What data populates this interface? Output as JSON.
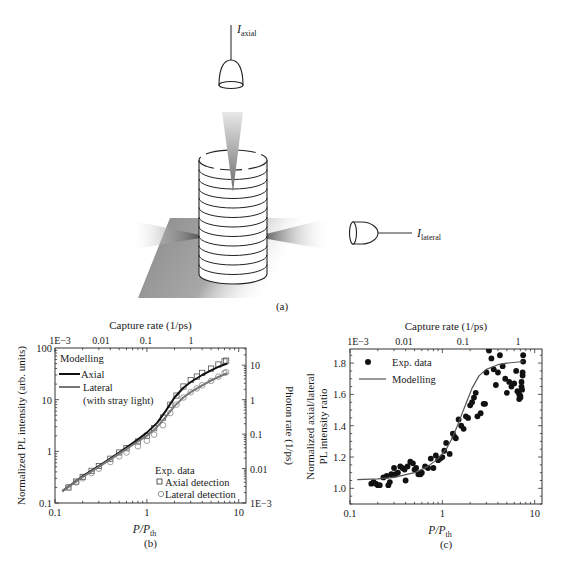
{
  "panel_a": {
    "label": "(a)",
    "axial_detector_label": "I",
    "axial_detector_sub": "axial",
    "lateral_detector_label": "I",
    "lateral_detector_sub": "lateral",
    "num_layers": 12
  },
  "chart_data": [
    {
      "id": "b",
      "type": "line",
      "panel_label": "(b)",
      "title": "",
      "top_axis_title": "Capture rate (1/ps)",
      "top_ticks": [
        "1E−3",
        "0.01",
        "0.1",
        "1"
      ],
      "xlabel": "P/P",
      "xlabel_sub": "th",
      "ylabel": "Normalized PL intensity (arb. units)",
      "y2label": "Photon rate (1/ps)",
      "xscale": "log",
      "yscale": "log",
      "xlim": [
        0.1,
        12
      ],
      "ylim": [
        0.1,
        100
      ],
      "x_ticks": [
        "0.1",
        "1",
        "10"
      ],
      "y_ticks": [
        "0.1",
        "1",
        "10",
        "100"
      ],
      "y2_ticks": [
        "1E−3",
        "0.01",
        "0.1",
        "1",
        "10"
      ],
      "legend_modelling_title": "Modelling",
      "legend_exp_title": "Exp. data",
      "series": [
        {
          "name": "Axial",
          "kind": "model",
          "color": "#111111",
          "x": [
            0.12,
            0.2,
            0.3,
            0.5,
            0.8,
            1.0,
            1.3,
            1.6,
            2.0,
            2.5,
            3.0,
            4.0,
            5.0,
            6.0,
            7.0,
            7.5
          ],
          "y": [
            0.17,
            0.33,
            0.52,
            0.95,
            1.7,
            2.3,
            3.6,
            6.0,
            11.0,
            17.0,
            22.0,
            30.0,
            37.0,
            43.0,
            48.0,
            50.0
          ]
        },
        {
          "name": "Lateral (with stray light)",
          "kind": "model",
          "color": "#777777",
          "x": [
            0.12,
            0.2,
            0.3,
            0.5,
            0.8,
            1.0,
            1.3,
            1.6,
            2.0,
            2.5,
            3.0,
            4.0,
            5.0,
            6.0,
            7.0,
            7.5
          ],
          "y": [
            0.17,
            0.32,
            0.5,
            0.9,
            1.55,
            2.0,
            3.0,
            4.6,
            7.5,
            11.0,
            14.0,
            19.0,
            23.5,
            27.5,
            31.0,
            32.5
          ]
        },
        {
          "name": "Axial detection",
          "kind": "exp",
          "marker": "square",
          "x": [
            0.14,
            0.17,
            0.2,
            0.25,
            0.3,
            0.4,
            0.5,
            0.6,
            0.8,
            1.0,
            1.2,
            1.5,
            1.8,
            2.1,
            2.5,
            3.0,
            3.5,
            4.0,
            5.0,
            6.0,
            7.0,
            7.3
          ],
          "y": [
            0.2,
            0.26,
            0.32,
            0.42,
            0.52,
            0.72,
            0.95,
            1.15,
            1.55,
            2.0,
            2.8,
            4.5,
            8.0,
            12.0,
            18.0,
            24.0,
            28.0,
            33.0,
            40.0,
            48.0,
            55.0,
            57.0
          ]
        },
        {
          "name": "Lateral detection",
          "kind": "exp",
          "marker": "circle",
          "x": [
            0.14,
            0.17,
            0.2,
            0.25,
            0.3,
            0.4,
            0.5,
            0.6,
            0.8,
            1.0,
            1.2,
            1.5,
            1.8,
            2.1,
            2.5,
            3.0,
            3.5,
            4.0,
            5.0,
            6.0,
            7.0,
            7.3
          ],
          "y": [
            0.2,
            0.25,
            0.3,
            0.38,
            0.46,
            0.62,
            0.8,
            0.95,
            1.25,
            1.6,
            2.1,
            3.2,
            5.5,
            8.0,
            11.0,
            14.0,
            16.5,
            19.0,
            23.0,
            28.0,
            33.0,
            34.0
          ]
        }
      ]
    },
    {
      "id": "c",
      "type": "scatter",
      "panel_label": "(c)",
      "title": "",
      "top_axis_title": "Capture rate (1/ps)",
      "top_ticks": [
        "1E−3",
        "0.01",
        "0.1",
        "1"
      ],
      "xlabel": "P/P",
      "xlabel_sub": "th",
      "ylabel": "Normalized axial/lateral",
      "ylabel2": "PL intensity ratio",
      "xscale": "log",
      "yscale": "linear",
      "xlim": [
        0.1,
        12
      ],
      "ylim": [
        0.9,
        1.89
      ],
      "x_ticks": [
        "0.1",
        "1",
        "10"
      ],
      "y_ticks": [
        "1.0",
        "1.2",
        "1.4",
        "1.6",
        "1.8"
      ],
      "legend": [
        "Exp. data",
        "Modelling"
      ],
      "series": [
        {
          "name": "Modelling",
          "kind": "model",
          "color": "#555555",
          "x": [
            0.12,
            0.2,
            0.3,
            0.5,
            0.7,
            0.9,
            1.1,
            1.3,
            1.5,
            1.8,
            2.1,
            2.5,
            3.0,
            4.0,
            5.0,
            7.5
          ],
          "y": [
            1.055,
            1.06,
            1.07,
            1.1,
            1.14,
            1.19,
            1.25,
            1.33,
            1.42,
            1.54,
            1.64,
            1.72,
            1.76,
            1.79,
            1.8,
            1.81
          ]
        },
        {
          "name": "Exp. data",
          "kind": "exp",
          "marker": "dot",
          "x": [
            0.17,
            0.18,
            0.19,
            0.2,
            0.21,
            0.23,
            0.25,
            0.26,
            0.27,
            0.28,
            0.3,
            0.31,
            0.33,
            0.35,
            0.37,
            0.39,
            0.4,
            0.42,
            0.45,
            0.48,
            0.5,
            0.52,
            0.55,
            0.58,
            0.6,
            0.65,
            0.7,
            0.75,
            0.8,
            0.85,
            0.9,
            0.95,
            1.0,
            1.05,
            1.1,
            1.2,
            1.3,
            1.35,
            1.4,
            1.5,
            1.6,
            1.7,
            1.8,
            1.9,
            2.0,
            2.1,
            2.2,
            2.3,
            2.4,
            2.6,
            2.8,
            2.9,
            3.0,
            3.2,
            3.4,
            3.6,
            3.8,
            4.0,
            4.2,
            4.5,
            4.8,
            5.0,
            5.3,
            5.6,
            6.0,
            6.3,
            6.5,
            6.8,
            7.0,
            7.2,
            7.3,
            7.4,
            7.5,
            7.5,
            7.4,
            7.2,
            7.0,
            6.8
          ],
          "y": [
            1.03,
            1.04,
            1.03,
            1.02,
            1.02,
            1.07,
            1.08,
            1.02,
            1.04,
            1.09,
            1.13,
            1.09,
            1.1,
            1.14,
            1.13,
            1.12,
            1.05,
            1.14,
            1.17,
            1.16,
            1.12,
            1.13,
            1.09,
            1.09,
            1.1,
            1.14,
            1.13,
            1.19,
            1.13,
            1.21,
            1.18,
            1.19,
            1.2,
            1.24,
            1.29,
            1.22,
            1.35,
            1.33,
            1.32,
            1.44,
            1.4,
            1.38,
            1.46,
            1.45,
            1.53,
            1.55,
            1.58,
            1.61,
            1.46,
            1.48,
            1.54,
            1.54,
            1.74,
            1.88,
            1.83,
            1.76,
            1.66,
            1.74,
            1.85,
            1.78,
            1.7,
            1.61,
            1.68,
            1.65,
            1.67,
            1.75,
            1.62,
            1.6,
            1.58,
            1.65,
            1.63,
            1.72,
            1.85,
            1.81,
            1.74,
            1.68,
            1.59,
            1.57
          ]
        }
      ]
    }
  ]
}
